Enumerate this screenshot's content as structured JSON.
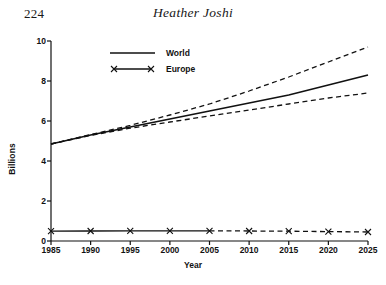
{
  "page": {
    "folio": "224",
    "running_title": "Heather Joshi"
  },
  "chart_data": {
    "type": "line",
    "title": "",
    "xlabel": "Year",
    "ylabel": "Billions",
    "xlim": [
      1985,
      2025
    ],
    "ylim": [
      0,
      10
    ],
    "grid": false,
    "legend_position": "top-left-inside",
    "x": [
      1985,
      1990,
      1995,
      2000,
      2005,
      2010,
      2015,
      2020,
      2025
    ],
    "xticks": [
      "1985",
      "1990",
      "1995",
      "2000",
      "2005",
      "2010",
      "2015",
      "2020",
      "2025"
    ],
    "yticks": [
      "0",
      "2",
      "4",
      "6",
      "8",
      "10"
    ],
    "series": [
      {
        "name": "World",
        "style": "solid",
        "marker": "none",
        "values": [
          4.85,
          5.3,
          5.7,
          6.1,
          6.5,
          6.9,
          7.3,
          7.8,
          8.3
        ]
      },
      {
        "name": "World high projection",
        "style": "dashed",
        "marker": "none",
        "legend": false,
        "values": [
          4.85,
          5.32,
          5.78,
          6.3,
          6.85,
          7.5,
          8.2,
          8.95,
          9.7
        ]
      },
      {
        "name": "World low projection",
        "style": "dashed",
        "marker": "none",
        "legend": false,
        "values": [
          4.85,
          5.28,
          5.64,
          5.95,
          6.25,
          6.55,
          6.85,
          7.15,
          7.4
        ]
      },
      {
        "name": "Europe",
        "style": "solid-then-dashed",
        "marker": "x",
        "values": [
          0.49,
          0.5,
          0.51,
          0.51,
          0.51,
          0.5,
          0.49,
          0.47,
          0.45
        ]
      }
    ],
    "legend": [
      {
        "label": "World",
        "style": "solid",
        "marker": "none"
      },
      {
        "label": "Europe",
        "style": "solid",
        "marker": "x"
      }
    ]
  }
}
